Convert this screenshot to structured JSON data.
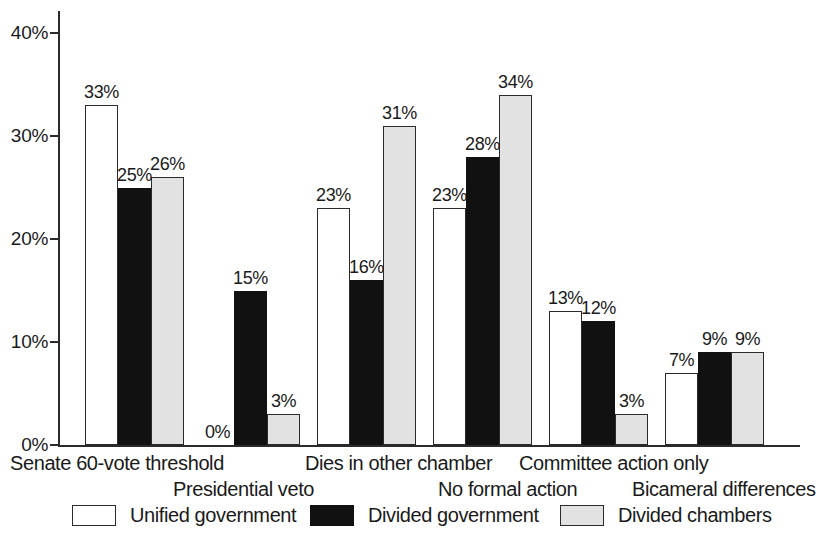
{
  "chart_data": {
    "type": "bar",
    "title": "",
    "subtitle": "",
    "xlabel": "",
    "ylabel": "",
    "ylim": [
      0,
      43
    ],
    "grid": false,
    "legend_position": "bottom",
    "value_labels": true,
    "value_label_suffix": "%",
    "categories": [
      "Senate 60-vote threshold",
      "Presidential veto",
      "Dies in other chamber",
      "No formal action",
      "Committee action only",
      "Bicameral differences"
    ],
    "y_ticks": [
      {
        "value": 0,
        "label": "0%"
      },
      {
        "value": 10,
        "label": "10%"
      },
      {
        "value": 20,
        "label": "20%"
      },
      {
        "value": 30,
        "label": "30%"
      },
      {
        "value": 40,
        "label": "40%"
      }
    ],
    "series": [
      {
        "name": "Unified government",
        "color": "#ffffff",
        "edge_color": "#2b2b2b",
        "values": [
          33,
          0,
          23,
          23,
          13,
          7
        ],
        "labels": [
          "33%",
          "0%",
          "23%",
          "23%",
          "13%",
          "7%"
        ]
      },
      {
        "name": "Divided government",
        "color": "#111111",
        "edge_color": "#111111",
        "values": [
          25,
          15,
          16,
          28,
          12,
          9
        ],
        "labels": [
          "25%",
          "15%",
          "16%",
          "28%",
          "12%",
          "9%"
        ]
      },
      {
        "name": "Divided chambers",
        "color": "#e2e2e2",
        "edge_color": "#2b2b2b",
        "values": [
          26,
          3,
          31,
          34,
          3,
          9
        ],
        "labels": [
          "26%",
          "3%",
          "31%",
          "34%",
          "3%",
          "9%"
        ]
      }
    ]
  },
  "legend": {
    "items": [
      {
        "label": "Unified government",
        "swatch": "unified"
      },
      {
        "label": "Divided government",
        "swatch": "divided-gov"
      },
      {
        "label": "Divided chambers",
        "swatch": "divided-cham"
      }
    ]
  },
  "axis": {
    "tick_labels": [
      "40%",
      "30%",
      "20%",
      "10%",
      "0%"
    ]
  }
}
